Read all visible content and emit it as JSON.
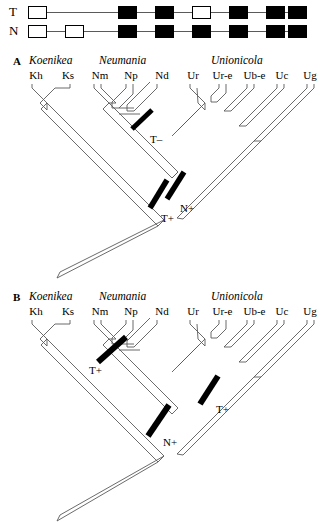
{
  "matrix": {
    "rows": [
      {
        "label": "T",
        "cells": [
          "empty",
          "none",
          "filled",
          "filled",
          "empty",
          "filled",
          "filled",
          "filled",
          "filled",
          "filled"
        ]
      },
      {
        "label": "N",
        "cells": [
          "empty",
          "empty",
          "filled",
          "filled",
          "filled",
          "filled",
          "filled",
          "filled",
          "filled",
          "filled"
        ]
      }
    ],
    "legend": {
      "filled_meaning": "black-box",
      "empty_meaning": "white-box"
    }
  },
  "taxa": [
    "Kh",
    "Ks",
    "Nm",
    "Np",
    "Nd",
    "Ur",
    "Ur-e",
    "Ub-e",
    "Uc",
    "Ug"
  ],
  "genera": [
    {
      "name": "Koenikea",
      "taxa": [
        "Kh",
        "Ks"
      ]
    },
    {
      "name": "Neumania",
      "taxa": [
        "Nm",
        "Np",
        "Nd"
      ]
    },
    {
      "name": "Unionicola",
      "taxa": [
        "Ur",
        "Ur-e",
        "Ub-e",
        "Uc",
        "Ug"
      ]
    }
  ],
  "panels": [
    {
      "letter": "A",
      "genera_labels": [
        "Koenikea",
        "Neumania",
        "Unionicola"
      ],
      "taxon_labels": [
        "Kh",
        "Ks",
        "Nm",
        "Np",
        "Nd",
        "Ur",
        "Ur-e",
        "Ub-e",
        "Uc",
        "Ug"
      ],
      "marks": [
        {
          "label": "T–",
          "bars": 1
        },
        {
          "label": "N+",
          "bars": 1
        },
        {
          "label": "T+",
          "bars": 1
        }
      ],
      "mark_t_minus": "T–",
      "mark_n_plus": "N+",
      "mark_t_plus": "T+"
    },
    {
      "letter": "B",
      "genera_labels": [
        "Koenikea",
        "Neumania",
        "Unionicola"
      ],
      "taxon_labels": [
        "Kh",
        "Ks",
        "Nm",
        "Np",
        "Nd",
        "Ur",
        "Ur-e",
        "Ub-e",
        "Uc",
        "Ug"
      ],
      "marks": [
        {
          "label": "T+",
          "bars": 1
        },
        {
          "label": "T+",
          "bars": 1
        },
        {
          "label": "N+",
          "bars": 1
        }
      ],
      "mark_t_plus_neumania": "T+",
      "mark_t_plus_unionicola": "T+",
      "mark_n_plus": "N+"
    }
  ],
  "colors": {
    "line": "#5a5a5a",
    "fill_black": "#000000",
    "fill_white": "#ffffff",
    "background": "#ffffff"
  }
}
